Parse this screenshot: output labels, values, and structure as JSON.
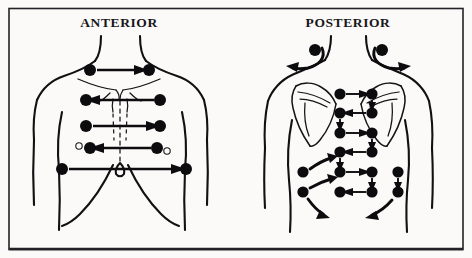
{
  "figure": {
    "kind": "medical-illustration",
    "background_color": "#fbfaf8",
    "ink_color": "#0c0c0f",
    "border_color": "#232327"
  },
  "panels": [
    {
      "id": "anterior",
      "title": "ANTERIOR",
      "title_x": 119,
      "title_y": 27,
      "description": "Front of torso with paired examination sites connected by horizontal arrows",
      "site_count": 10,
      "rows": [
        {
          "row": 1,
          "y": 70,
          "left_x": 90,
          "right_x": 149,
          "direction": "right",
          "landmark": "supraclavicular"
        },
        {
          "row": 2,
          "y": 100,
          "left_x": 86,
          "right_x": 160,
          "direction": "left",
          "landmark": "upper-chest"
        },
        {
          "row": 3,
          "y": 126,
          "left_x": 86,
          "right_x": 160,
          "direction": "right",
          "landmark": "mid-chest"
        },
        {
          "row": 4,
          "y": 148,
          "left_x": 90,
          "right_x": 157,
          "direction": "left",
          "landmark": "nipple-line"
        },
        {
          "row": 5,
          "y": 169,
          "left_x": 62,
          "right_x": 186,
          "direction": "right",
          "landmark": "lower-lateral-chest"
        }
      ]
    },
    {
      "id": "posterior",
      "title": "POSTERIOR",
      "title_x": 348,
      "title_y": 27,
      "description": "Back of torso with serpentine ladder of examination sites between the scapulae and lateral flank sites",
      "site_count": 18,
      "shoulder_sites": [
        {
          "x": 315,
          "y": 50,
          "sweep": "left-down"
        },
        {
          "x": 382,
          "y": 50,
          "sweep": "right-down"
        }
      ],
      "ladder_rows": [
        {
          "row": 1,
          "y": 94,
          "left_x": 340,
          "right_x": 372,
          "direction": "right"
        },
        {
          "row": 2,
          "y": 113,
          "left_x": 340,
          "right_x": 372,
          "direction": "left"
        },
        {
          "row": 3,
          "y": 133,
          "left_x": 340,
          "right_x": 372,
          "direction": "right"
        },
        {
          "row": 4,
          "y": 152,
          "left_x": 340,
          "right_x": 372,
          "direction": "left"
        },
        {
          "row": 5,
          "y": 172,
          "left_x": 340,
          "right_x": 372,
          "direction": "right"
        },
        {
          "row": 6,
          "y": 192,
          "left_x": 340,
          "right_x": 372,
          "direction": "left"
        }
      ],
      "flank_sites": [
        {
          "side": "left",
          "x": 303,
          "y": 172,
          "sweep": "up-right"
        },
        {
          "side": "left",
          "x": 303,
          "y": 192,
          "sweep": "down-left"
        },
        {
          "side": "right",
          "x": 398,
          "y": 172,
          "sweep": "down"
        },
        {
          "side": "right",
          "x": 398,
          "y": 192,
          "sweep": "down-left"
        }
      ]
    }
  ]
}
